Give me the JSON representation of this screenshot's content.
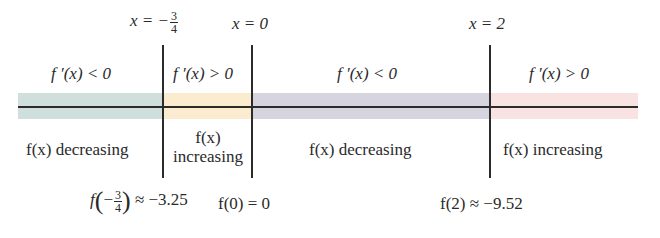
{
  "colors": {
    "band_1": "#cfdfdc",
    "band_2": "#fbeccf",
    "band_3": "#d6d4de",
    "band_4": "#f8e2e2",
    "lines": "#2b2b2b"
  },
  "critical_points": [
    {
      "label_prefix": "x = −",
      "frac_num": "3",
      "frac_den": "4"
    },
    {
      "label": "x = 0"
    },
    {
      "label": "x = 2"
    }
  ],
  "intervals": [
    {
      "sign": "f ′(x) < 0",
      "behavior": "f(x) decreasing"
    },
    {
      "sign": "f ′(x) > 0",
      "behavior_line1": "f(x)",
      "behavior_line2": "increasing"
    },
    {
      "sign": "f ′(x) < 0",
      "behavior": "f(x) decreasing"
    },
    {
      "sign": "f ′(x) > 0",
      "behavior": "f(x) increasing"
    }
  ],
  "values": [
    {
      "prefix": "f",
      "frac_num": "3",
      "frac_den": "4",
      "minus": "−",
      "suffix": " ≈ −3.25"
    },
    {
      "text": "f(0) = 0"
    },
    {
      "text": "f(2) ≈ −9.52"
    }
  ]
}
